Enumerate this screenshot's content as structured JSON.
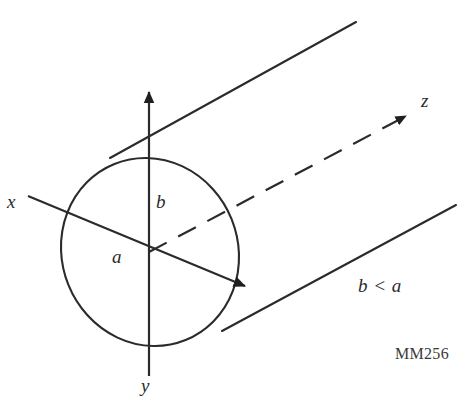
{
  "figure": {
    "stroke_color": "#2b2b2b",
    "background_color": "#ffffff",
    "labels": {
      "x_axis": "x",
      "y_axis": "y",
      "z_axis": "z",
      "semi_major": "a",
      "semi_minor": "b",
      "relation": "b < a",
      "figure_code": "MM256"
    },
    "geometry": {
      "origin": {
        "x": 149,
        "y": 252
      },
      "ellipse": {
        "center_x": 150,
        "center_y": 252,
        "radius_x": 88,
        "radius_y": 95,
        "rotation_deg": -22
      },
      "y_axis": {
        "x1": 149,
        "y1": 88,
        "x2": 149,
        "y2": 376,
        "arrow": "up",
        "dashed": false
      },
      "x_axis": {
        "x1": 28,
        "y1": 196,
        "x2": 248,
        "y2": 287,
        "arrow": "end",
        "dashed": false
      },
      "z_axis": {
        "x1": 149,
        "y1": 252,
        "x2": 412,
        "y2": 113,
        "arrow": "end",
        "dashed": true
      },
      "cylinder_top_edge": {
        "x1": 110,
        "y1": 158,
        "x2": 356,
        "y2": 22
      },
      "cylinder_bottom_edge": {
        "x1": 222,
        "y1": 331,
        "x2": 456,
        "y2": 205
      }
    }
  }
}
